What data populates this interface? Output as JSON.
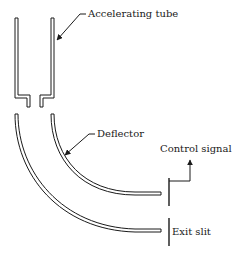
{
  "diagram": {
    "labels": {
      "accelerating_tube": "Accelerating tube",
      "deflector": "Deflector",
      "control_signal": "Control signal",
      "exit_slit": "Exit slit"
    },
    "colors": {
      "line": "#1a1a1a",
      "background": "#ffffff"
    }
  }
}
